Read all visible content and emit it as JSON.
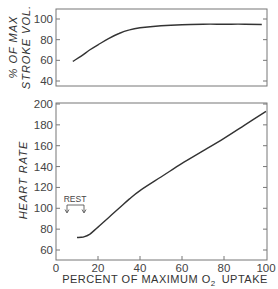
{
  "chart_data": [
    {
      "type": "line",
      "panel": "top",
      "title": "",
      "xlabel": "PERCENT OF MAXIMUM O2 UPTAKE",
      "ylabel": "% OF MAX STROKE VOL",
      "ylabel_lines": [
        "% OF MAX",
        "STROKE VOL"
      ],
      "xlim": [
        0,
        100
      ],
      "ylim": [
        37,
        106
      ],
      "yticks": [
        40,
        60,
        80,
        100
      ],
      "grid": false,
      "x": [
        8,
        12,
        16,
        20,
        25,
        30,
        35,
        40,
        50,
        60,
        70,
        80,
        90,
        98
      ],
      "values": [
        59,
        64,
        70,
        75,
        81,
        86,
        89.5,
        91.5,
        93.5,
        94.5,
        95,
        95,
        95,
        94.7
      ]
    },
    {
      "type": "line",
      "panel": "bottom",
      "title": "",
      "xlabel": "PERCENT OF MAXIMUM O2 UPTAKE",
      "ylabel": "HEART RATE",
      "xlim": [
        0,
        100
      ],
      "ylim": [
        52,
        200
      ],
      "xticks": [
        0,
        20,
        40,
        60,
        80,
        100
      ],
      "yticks": [
        60,
        80,
        100,
        120,
        140,
        160,
        180,
        200
      ],
      "grid": false,
      "x": [
        10,
        13,
        16,
        20,
        25,
        30,
        35,
        40,
        50,
        60,
        70,
        80,
        90,
        100
      ],
      "values": [
        72,
        72.5,
        75,
        82,
        91,
        100,
        109,
        117,
        130,
        143,
        155,
        167,
        180,
        193
      ],
      "annotations": [
        {
          "text": "REST",
          "x_range": [
            5,
            14
          ],
          "y": 100,
          "note": "bracket with downward arrows at both ends"
        }
      ]
    }
  ],
  "labels": {
    "top_ylabel_line1": "% OF MAX",
    "top_ylabel_line2": "STROKE VOL.",
    "bottom_ylabel": "HEART RATE",
    "xlabel_prefix": "PERCENT OF MAXIMUM O",
    "xlabel_sub": "2",
    "xlabel_suffix": "UPTAKE",
    "rest": "REST",
    "top_ticks": [
      "100",
      "80",
      "60",
      "40"
    ],
    "bottom_ticks": [
      "200",
      "180",
      "160",
      "140",
      "120",
      "100",
      "80",
      "60"
    ],
    "x_ticks": [
      "0",
      "20",
      "40",
      "60",
      "80",
      "100"
    ]
  },
  "colors": {
    "line": "#333333",
    "axis": "#666666",
    "background": "#ffffff"
  }
}
